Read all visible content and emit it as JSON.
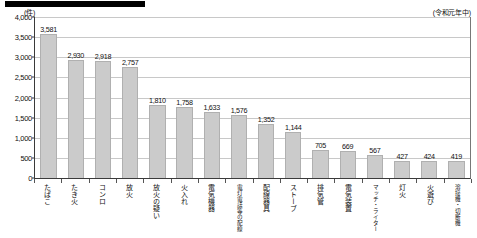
{
  "header": {
    "unit_label": "(件)",
    "period_note": "(令和元年中)",
    "banner_text": ""
  },
  "chart_data": {
    "type": "bar",
    "title": "",
    "xlabel": "",
    "ylabel": "(件)",
    "ylim": [
      0,
      4000
    ],
    "yticks": [
      0,
      500,
      1000,
      1500,
      2000,
      2500,
      3000,
      3500,
      4000
    ],
    "ytick_labels": [
      "0",
      "500",
      "1,000",
      "1,500",
      "2,000",
      "2,500",
      "3,000",
      "3,500",
      "4,000"
    ],
    "grid": true,
    "legend": "none",
    "annotation": "(令和元年中)",
    "categories": [
      "たばこ",
      "たき火",
      "コンロ",
      "放火",
      "放火の疑い",
      "火入れ",
      "電気機器",
      "電灯電話等の配線",
      "配線器具",
      "ストーブ",
      "排気管",
      "電気装置",
      "マッチ・ライター",
      "灯火",
      "火遊び",
      "溶接機・切断機"
    ],
    "values": [
      3581,
      2930,
      2918,
      2757,
      1810,
      1758,
      1633,
      1576,
      1352,
      1144,
      705,
      669,
      567,
      427,
      424,
      419
    ],
    "value_labels": [
      "3,581",
      "2,930",
      "2,918",
      "2,757",
      "1,810",
      "1,758",
      "1,633",
      "1,576",
      "1,352",
      "1,144",
      "705",
      "669",
      "567",
      "427",
      "424",
      "419"
    ],
    "bar_color": "#cbcbcb",
    "bar_border_color": "#b0b0b0",
    "axis_color": "#3a3a3a",
    "grid_color": "#c8c8c8"
  }
}
